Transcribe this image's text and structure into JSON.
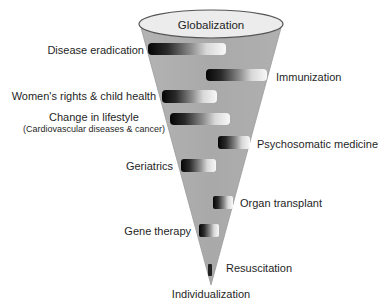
{
  "diagram": {
    "top_label": "Globalization",
    "bottom_label": "Individualization",
    "colors": {
      "cone_fill": "#adadad",
      "cone_edge": "#8a8a8a",
      "ellipse_fill": "#ececec",
      "ellipse_stroke": "#5a5a5a",
      "bar_dark": "#0a0a0a",
      "bar_light": "#f4f4f4"
    },
    "items": [
      {
        "label": "Disease eradication",
        "side": "left"
      },
      {
        "label": "Immunization",
        "side": "right"
      },
      {
        "label": "Women's rights & child health",
        "side": "left"
      },
      {
        "label": "Change in lifestyle",
        "sublabel": "(Cardiovascular diseases & cancer)",
        "side": "left"
      },
      {
        "label": "Psychosomatic medicine",
        "side": "right"
      },
      {
        "label": "Geriatrics",
        "side": "left"
      },
      {
        "label": "Organ transplant",
        "side": "right"
      },
      {
        "label": "Gene therapy",
        "side": "left"
      },
      {
        "label": "Resuscitation",
        "side": "right"
      }
    ]
  }
}
